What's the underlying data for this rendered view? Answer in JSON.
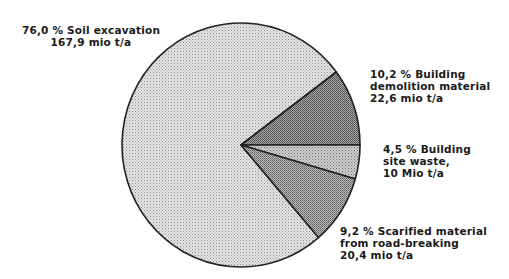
{
  "chart_data": {
    "type": "pie",
    "title": "",
    "unit": "mio t/a",
    "start_angle_note": "slices drawn clockwise from 3 o'clock direction",
    "slices": [
      {
        "name": "Soil excavation",
        "percent": 76.0,
        "value": 167.9,
        "percent_label": "76,0 %",
        "value_label": "167,9 mio t/a",
        "fill": "#d4d4d4"
      },
      {
        "name": "Building demolition material",
        "percent": 10.2,
        "value": 22.6,
        "percent_label": "10,2 %",
        "value_label": "22,6 mio t/a",
        "fill": "#8a8a8a"
      },
      {
        "name": "Building site waste",
        "percent": 4.5,
        "value": 10,
        "percent_label": "4,5 %",
        "value_label": "10 Mio t/a",
        "fill": "#bdbdbd"
      },
      {
        "name": "Scarified material from road-breaking",
        "percent": 9.2,
        "value": 20.4,
        "percent_label": "9,2 %",
        "value_label": "20,4 mio t/a",
        "fill": "#9e9e9e"
      }
    ]
  },
  "labels": {
    "soil": {
      "line1": "76,0 % Soil excavation",
      "line2": "167,9 mio t/a"
    },
    "demolition": {
      "line1": "10,2 % Building",
      "line2": "demolition material",
      "line3": "22,6 mio t/a"
    },
    "site_waste": {
      "line1": "4,5 % Building",
      "line2": "site waste,",
      "line3": "10 Mio t/a"
    },
    "scarified": {
      "line1": "9,2 % Scarified material",
      "line2": "from road-breaking",
      "line3": "20,4 mio t/a"
    }
  }
}
